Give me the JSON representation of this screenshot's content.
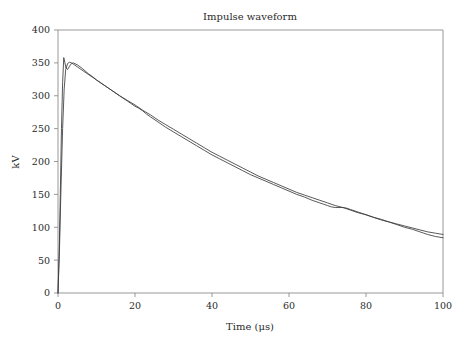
{
  "figure": {
    "title": "Impulse waveform",
    "background_color": "#ffffff",
    "frame_color": "#8d8d8d",
    "text_color": "#2b2b2b"
  },
  "axes": {
    "x_axis_label": "Time (μs)",
    "y_axis_label": "kV",
    "x_ticks": [
      "0",
      "20",
      "40",
      "60",
      "80",
      "100"
    ],
    "y_ticks": [
      "0",
      "50",
      "100",
      "150",
      "200",
      "250",
      "300",
      "350",
      "400"
    ]
  },
  "chart_data": {
    "type": "line",
    "title": "Impulse waveform",
    "xlabel": "Time (μs)",
    "ylabel": "kV",
    "xlim": [
      0,
      100
    ],
    "ylim": [
      0,
      400
    ],
    "xticks": [
      0,
      20,
      40,
      60,
      80,
      100
    ],
    "yticks": [
      0,
      50,
      100,
      150,
      200,
      250,
      300,
      350,
      400
    ],
    "grid": false,
    "legend": "none",
    "series": [
      {
        "name": "measured impulse",
        "color": "#3b3b3b",
        "x": [
          0,
          0.3,
          0.6,
          0.9,
          1.2,
          1.5,
          1.8,
          2.1,
          2.5,
          3,
          3.5,
          4,
          5,
          6,
          7,
          8,
          9,
          10,
          12,
          14,
          16,
          18,
          19,
          20,
          21,
          22,
          23,
          24,
          26,
          28,
          30,
          32,
          34,
          36,
          38,
          40,
          42,
          44,
          46,
          48,
          50,
          52,
          54,
          56,
          58,
          60,
          62,
          64,
          66,
          68,
          69,
          70,
          71,
          72,
          73,
          74,
          75,
          76,
          78,
          80,
          82,
          84,
          86,
          88,
          90,
          92,
          94,
          95,
          96,
          98,
          100
        ],
        "y": [
          0,
          60,
          150,
          250,
          320,
          358,
          350,
          342,
          340,
          345,
          349,
          350,
          347,
          343,
          338,
          333,
          329,
          324,
          316,
          308,
          300,
          292,
          288,
          284,
          281,
          277,
          272,
          268,
          260,
          252,
          245,
          238,
          231,
          224,
          217,
          210,
          204,
          198,
          192,
          186,
          180,
          175,
          170,
          165,
          160,
          155,
          150,
          146,
          141,
          137,
          135,
          133,
          131,
          130,
          130,
          130,
          129,
          127,
          123,
          119,
          115,
          111,
          108,
          104,
          100,
          97,
          93,
          91,
          89,
          86,
          84
        ]
      },
      {
        "name": "fitted double-exponential",
        "color": "#3b3b3b",
        "x": [
          0,
          0.4,
          0.8,
          1.2,
          1.6,
          2,
          2.5,
          3,
          3.5,
          4,
          5,
          6,
          7,
          8,
          10,
          12,
          14,
          16,
          18,
          20,
          22,
          24,
          26,
          28,
          30,
          32,
          34,
          36,
          38,
          40,
          42,
          44,
          46,
          48,
          50,
          52,
          54,
          56,
          58,
          60,
          62,
          64,
          66,
          68,
          70,
          72,
          74,
          76,
          78,
          80,
          82,
          84,
          86,
          88,
          90,
          92,
          94,
          96,
          98,
          100
        ],
        "y": [
          0,
          70,
          165,
          250,
          310,
          340,
          349,
          351,
          350,
          348,
          344,
          340,
          336,
          332,
          324,
          316,
          308,
          300,
          293,
          286,
          278,
          271,
          263,
          256,
          249,
          242,
          235,
          228,
          221,
          214,
          208,
          202,
          196,
          190,
          184,
          178,
          173,
          168,
          163,
          158,
          153,
          149,
          145,
          141,
          137,
          133,
          130,
          126,
          122,
          119,
          115,
          112,
          108,
          105,
          102,
          99,
          96,
          93,
          91,
          89
        ]
      }
    ]
  }
}
